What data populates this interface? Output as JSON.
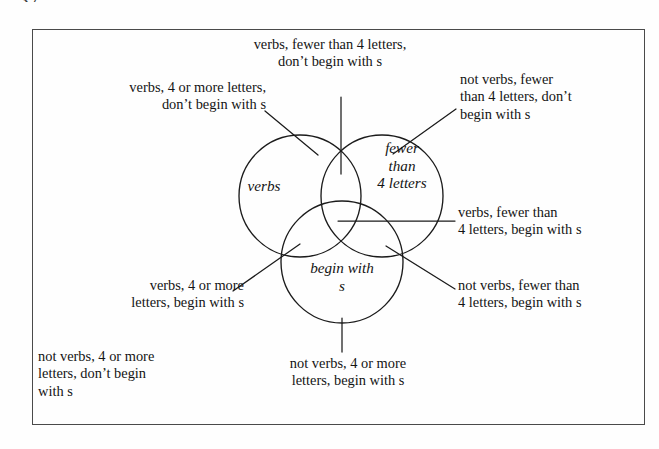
{
  "page": {
    "number_fragment": "37.",
    "frame_border_color": "#4a4a4a",
    "background_color": "#fefefe",
    "ink_color": "#141414"
  },
  "diagram": {
    "type": "venn",
    "sets": [
      {
        "id": "verbs",
        "label": "verbs",
        "position": "left"
      },
      {
        "id": "fewer",
        "label": "fewer\nthan\n4 letters",
        "position": "right"
      },
      {
        "id": "begins",
        "label": "begin with\ns",
        "position": "bottom"
      }
    ],
    "region_labels": {
      "top": "verbs, fewer than 4 letters,\ndon’t begin with s",
      "top_left": "verbs, 4 or more letters,\ndon’t begin with s",
      "top_right": "not verbs, fewer\nthan 4 letters, don’t\nbegin with s",
      "middle_right": "verbs, fewer than\n4 letters, begin with s",
      "bottom_right": "not verbs, fewer than\n4 letters, begin with s",
      "middle_left": "verbs, 4 or more\nletters, begin with s",
      "bottom_left": "not verbs, 4 or more\nletters, don’t begin\nwith s",
      "bottom_center": "not verbs, 4 or more\nletters, begin with s"
    }
  },
  "geometry": {
    "circles": [
      {
        "name": "verbs-circle",
        "cx": 300,
        "cy": 196,
        "r": 61
      },
      {
        "name": "fewer-circle",
        "cx": 382,
        "cy": 196,
        "r": 61
      },
      {
        "name": "begins-circle",
        "cx": 342,
        "cy": 262,
        "r": 61
      }
    ],
    "leader_lines": [
      {
        "name": "leader-top",
        "x1": 341,
        "y1": 97,
        "x2": 341,
        "y2": 174
      },
      {
        "name": "leader-top-left",
        "x1": 265,
        "y1": 111,
        "x2": 318,
        "y2": 155
      },
      {
        "name": "leader-top-right",
        "x1": 456,
        "y1": 109,
        "x2": 393,
        "y2": 154
      },
      {
        "name": "leader-middle-right",
        "x1": 455,
        "y1": 221,
        "x2": 338,
        "y2": 221
      },
      {
        "name": "leader-bottom-right",
        "x1": 455,
        "y1": 289,
        "x2": 386,
        "y2": 246
      },
      {
        "name": "leader-middle-left",
        "x1": 233,
        "y1": 291,
        "x2": 300,
        "y2": 244
      },
      {
        "name": "leader-bottom-center",
        "x1": 342,
        "y1": 318,
        "x2": 342,
        "y2": 352
      }
    ]
  }
}
